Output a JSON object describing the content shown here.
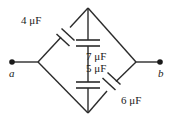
{
  "figure": {
    "background_color": "#ffffff",
    "line_color": "#2b2b2b"
  },
  "terminals": [
    {
      "id": "a",
      "label": "a",
      "x": 12,
      "y": 62
    },
    {
      "id": "b",
      "label": "b",
      "x": 160,
      "y": 62
    }
  ],
  "nodes": {
    "left": {
      "x": 38,
      "y": 62
    },
    "top": {
      "x": 88,
      "y": 8
    },
    "bottom": {
      "x": 88,
      "y": 113
    },
    "right": {
      "x": 136,
      "y": 62
    }
  },
  "capacitors": [
    {
      "id": "c4",
      "value": "4",
      "unit": "μF",
      "label": "4 μF",
      "branch": "left-to-top",
      "orientation": "diagonal"
    },
    {
      "id": "c7",
      "value": "7",
      "unit": "μF",
      "label": "7 μF",
      "branch": "top-to-center",
      "orientation": "vertical"
    },
    {
      "id": "c5",
      "value": "5",
      "unit": "μF",
      "label": "5 μF",
      "branch": "center-to-bottom",
      "orientation": "vertical"
    },
    {
      "id": "c6",
      "value": "6",
      "unit": "μF",
      "label": "6 μF",
      "branch": "bottom-to-right",
      "orientation": "diagonal"
    }
  ]
}
